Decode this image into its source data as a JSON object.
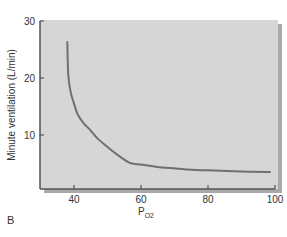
{
  "chart_data": {
    "type": "line",
    "title": "",
    "panel_label": "B",
    "xlabel": "P",
    "xlabel_subscript": "O2",
    "ylabel": "Minute ventilation (L/min)",
    "xlim": [
      35,
      100
    ],
    "ylim": [
      0,
      30
    ],
    "x_ticks": [
      40,
      60,
      80,
      100
    ],
    "y_ticks": [
      10,
      20,
      30
    ],
    "grid": false,
    "legend": null,
    "series": [
      {
        "name": "Ventilatory response to hypoxia",
        "color": "#707070",
        "x": [
          38,
          38.3,
          39,
          40,
          41.2,
          43,
          44.8,
          47,
          50,
          53,
          56.7,
          60,
          65,
          68.7,
          75,
          80,
          90,
          98.5
        ],
        "y": [
          26.3,
          20.5,
          17.5,
          15.5,
          13.5,
          12.0,
          10.9,
          9.4,
          7.9,
          6.5,
          5.1,
          4.8,
          4.4,
          4.2,
          3.9,
          3.8,
          3.6,
          3.5
        ]
      }
    ],
    "colors": {
      "plot_background": "#d6d6d6",
      "plot_shadow": "#a9a9a9",
      "axis": "#555555",
      "curve": "#707070"
    }
  }
}
